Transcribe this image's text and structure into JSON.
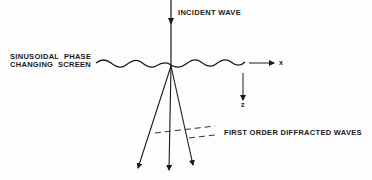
{
  "diagram": {
    "labels": {
      "incident": "INCIDENT WAVE",
      "screen_line1": "SINUSOIDAL  PHASE",
      "screen_line2": "CHANGING  SCREEN",
      "x_axis": "x",
      "z_axis": "z",
      "diffracted": "FIRST ORDER DIFFRACTED WAVES"
    },
    "colors": {
      "ink": "#1a1a1a",
      "background": "#fdfdfd"
    }
  }
}
